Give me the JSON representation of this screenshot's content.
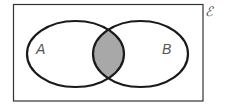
{
  "diagram": {
    "type": "venn",
    "title": "",
    "universal_set_label": "ℰ",
    "sets": [
      {
        "name": "A",
        "label": "A"
      },
      {
        "name": "B",
        "label": "B"
      }
    ],
    "shaded_region": "A ∩ B",
    "colors": {
      "stroke": "#1a1a1a",
      "shade": "#a8a8a8",
      "background": "#ffffff",
      "label": "#555555"
    }
  }
}
